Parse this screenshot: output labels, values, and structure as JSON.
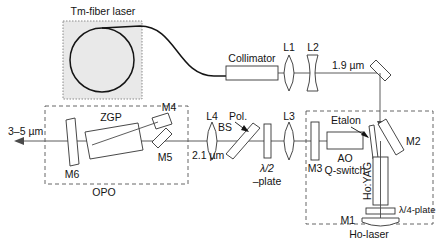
{
  "figure": {
    "type": "optical-setup-diagram"
  },
  "modules": {
    "pump": {
      "label": "Tm-fiber laser"
    },
    "opo": {
      "label": "OPO"
    },
    "ho_laser": {
      "label": "Ho-laser"
    }
  },
  "beam_labels": {
    "output": "3–5 µm",
    "opo_input": "2.1 µm",
    "pump_wavelength": "1.9 µm"
  },
  "components": {
    "collimator": "Collimator",
    "l1": "L1",
    "l2": "L2",
    "l3": "L3",
    "l4": "L4",
    "pol_bs_line1": "Pol.",
    "pol_bs_line2": "BS",
    "half_wave_line1": "λ/2",
    "half_wave_line2": "–plate",
    "quarter_wave": "λ/4-plate",
    "m1": "M1",
    "m2": "M2",
    "m3": "M3",
    "m4": "M4",
    "m5": "M5",
    "m6": "M6",
    "zgp": "ZGP",
    "etalon": "Etalon",
    "ao_line1": "AO",
    "ao_line2": "Q-switch",
    "ho_yag": "Ho:YAG"
  },
  "colors": {
    "pump_box_fill": "#e9e9e9",
    "pump_box_border": "#8a8a8a",
    "dashed_box": "#555555",
    "beam": "#4a4a4a",
    "optic_stroke": "#333333",
    "text": "#141414",
    "background": "#ffffff"
  }
}
